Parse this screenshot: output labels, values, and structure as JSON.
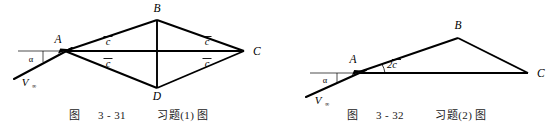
{
  "page": {
    "background_color": "#ffffff",
    "ink_color": "#000000",
    "width": 556,
    "height": 134
  },
  "figures": [
    {
      "id": "figure-3-31",
      "caption": {
        "prefix": "图",
        "number": "3 - 31",
        "title": "习题(1) 图",
        "full": "图 3 - 31  习题(1) 图"
      },
      "shape": "rhombus",
      "vertices": [
        {
          "name": "A",
          "label": "A",
          "x": 65,
          "y": 51
        },
        {
          "name": "B",
          "label": "B",
          "x": 157,
          "y": 20
        },
        {
          "name": "C",
          "label": "C",
          "x": 244,
          "y": 51
        },
        {
          "name": "D",
          "label": "D",
          "x": 157,
          "y": 88
        }
      ],
      "edge_labels": [
        {
          "name": "c-bar-upper-left",
          "text": "c",
          "overbar": true,
          "x": 108,
          "y": 42
        },
        {
          "name": "c-bar-lower-left",
          "text": "c",
          "overbar": true,
          "x": 108,
          "y": 64
        },
        {
          "name": "c-bar-upper-right",
          "text": "c",
          "overbar": true,
          "x": 207,
          "y": 42
        },
        {
          "name": "c-bar-lower-right",
          "text": "c",
          "overbar": true,
          "x": 207,
          "y": 64
        }
      ],
      "angle": {
        "name": "alpha",
        "label": "α",
        "x": 31,
        "y": 61
      },
      "velocity": {
        "name": "V-infinity",
        "label": "V",
        "subscript": "∞",
        "x": 28,
        "y": 83
      },
      "horizontal_reference_line": {
        "x1": 18,
        "y1": 51,
        "x2": 244,
        "y2": 51
      }
    },
    {
      "id": "figure-3-32",
      "caption": {
        "prefix": "图",
        "number": "3 - 32",
        "title": "习题(2) 图",
        "full": "图 3 - 32  习题(2) 图"
      },
      "shape": "triangle",
      "vertices": [
        {
          "name": "A",
          "label": "A",
          "x": 81,
          "y": 72
        },
        {
          "name": "B",
          "label": "B",
          "x": 180,
          "y": 38
        },
        {
          "name": "C",
          "label": "C",
          "x": 250,
          "y": 73
        }
      ],
      "edge_labels": [
        {
          "name": "two-c-bar",
          "text": "2c",
          "overbar": true,
          "x": 112,
          "y": 62
        }
      ],
      "angle": {
        "name": "alpha",
        "label": "α",
        "x": 47,
        "y": 81
      },
      "velocity": {
        "name": "V-infinity",
        "label": "V",
        "subscript": "∞",
        "x": 43,
        "y": 101
      },
      "horizontal_reference_line": {
        "x1": 32,
        "y1": 73,
        "x2": 250,
        "y2": 73
      }
    }
  ]
}
